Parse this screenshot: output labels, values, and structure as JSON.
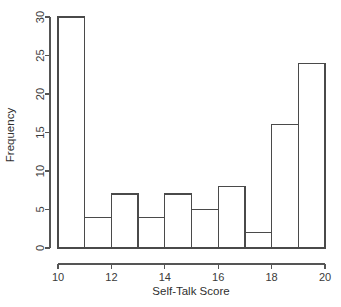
{
  "chart_data": {
    "type": "bar",
    "title": "",
    "subtitle": "",
    "xlabel": "Self-Talk Score",
    "ylabel": "Frequency",
    "categories": [
      "10-11",
      "11-12",
      "12-13",
      "13-14",
      "14-15",
      "15-16",
      "16-17",
      "17-18",
      "18-19",
      "19-20"
    ],
    "bin_edges": [
      10,
      11,
      12,
      13,
      14,
      15,
      16,
      17,
      18,
      19,
      20
    ],
    "values": [
      30,
      4,
      7,
      4,
      7,
      5,
      8,
      2,
      16,
      24
    ],
    "bin_width": 1,
    "xlim": [
      10,
      20
    ],
    "ylim": [
      0,
      30
    ],
    "x_ticks": [
      10,
      12,
      14,
      16,
      18,
      20
    ],
    "x_tick_labels": [
      "10",
      "12",
      "14",
      "16",
      "18",
      "20"
    ],
    "y_ticks": [
      0,
      5,
      10,
      15,
      20,
      25,
      30
    ],
    "y_tick_labels": [
      "0",
      "5",
      "10",
      "15",
      "20",
      "25",
      "30"
    ],
    "grid": false,
    "legend": false,
    "bar_fill": "none",
    "bar_stroke": "#4a4a4a",
    "axis_color": "#555555",
    "background": "#ffffff"
  },
  "plot_geometry": {
    "left": 58,
    "right": 325,
    "baseline_y": 248,
    "top_y": 17,
    "px_per_unit_x": 26.7,
    "px_per_unit_y": 7.7
  }
}
